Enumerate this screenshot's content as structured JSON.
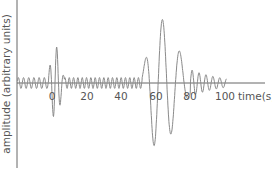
{
  "chart_data": {
    "type": "line",
    "title": "",
    "xlabel": "time(s)",
    "ylabel": "amplitude (arbitrary units)",
    "x_ticks": [
      0,
      20,
      40,
      60,
      80,
      100
    ],
    "x_tick_labels": [
      "0",
      "20",
      "40",
      "60",
      "80",
      "100"
    ],
    "xlim": [
      -20,
      125
    ],
    "ylim": [
      -1.0,
      1.0
    ],
    "grid": false,
    "legend": null,
    "series": [
      {
        "name": "seismogram",
        "color": "#888888",
        "description": "Oscillating trace: small background oscillations, burst near t≈0-5s (P-wave), quiet small oscillations 5-50s, large burst 50-80s (S/surface waves) peaking near t≈65s, decaying small oscillations until ~100s",
        "segments": [
          {
            "t_start": -20,
            "t_end": -2,
            "amplitude": 0.08,
            "period": 3.0
          },
          {
            "t_start": -2,
            "t_end": 7,
            "amplitude": 0.55,
            "period": 4.0,
            "peak_t": 2
          },
          {
            "t_start": 7,
            "t_end": 52,
            "amplitude": 0.08,
            "period": 2.5
          },
          {
            "t_start": 52,
            "t_end": 80,
            "amplitude": 0.95,
            "period": 10.0,
            "peak_t": 65
          },
          {
            "t_start": 80,
            "t_end": 101,
            "amplitude": 0.2,
            "period": 4.0
          }
        ]
      }
    ]
  },
  "axes": {
    "x_label": "time(s)",
    "y_label": "amplitude (arbitrary units)",
    "tick_0": "0",
    "tick_20": "20",
    "tick_40": "40",
    "tick_60": "60",
    "tick_80": "80",
    "tick_100": "100"
  },
  "colors": {
    "axis": "#666666",
    "trace": "#8a8a8a",
    "text": "#555555"
  }
}
